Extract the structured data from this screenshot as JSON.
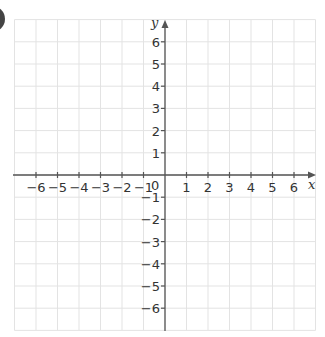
{
  "figure": {
    "type": "coordinate-grid",
    "badge_color": "#444444",
    "grid_color": "#e3e3e3",
    "axis_color": "#555555",
    "text_color": "#333333",
    "x_axis": {
      "name": "x",
      "min": -7,
      "max": 7,
      "tick_labels": [
        "−6",
        "−5",
        "−4",
        "−3",
        "−2",
        "−1",
        "1",
        "2",
        "3",
        "4",
        "5",
        "6"
      ],
      "tick_values": [
        -6,
        -5,
        -4,
        -3,
        -2,
        -1,
        1,
        2,
        3,
        4,
        5,
        6
      ]
    },
    "y_axis": {
      "name": "y",
      "min": -7,
      "max": 7,
      "tick_labels": [
        "6",
        "5",
        "4",
        "3",
        "2",
        "1",
        "−1",
        "−2",
        "−3",
        "−4",
        "−5",
        "−6"
      ],
      "tick_values": [
        6,
        5,
        4,
        3,
        2,
        1,
        -1,
        -2,
        -3,
        -4,
        -5,
        -6
      ]
    },
    "origin_label": "0"
  }
}
